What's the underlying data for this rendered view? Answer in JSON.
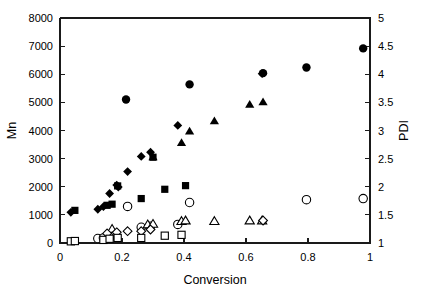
{
  "chart_data": {
    "type": "scatter",
    "title": "",
    "xlabel": "Conversion",
    "ylabel": "Mn",
    "y2label": "PDI",
    "xlim": [
      0,
      1
    ],
    "ylim": [
      0,
      8000
    ],
    "y2lim": [
      1,
      5
    ],
    "xticks": [
      0,
      0.2,
      0.4,
      0.6,
      0.8,
      1
    ],
    "xticklabels": [
      "0",
      "0.2",
      "0.4",
      "0.6",
      "0.8",
      "1"
    ],
    "yticks": [
      0,
      1000,
      2000,
      3000,
      4000,
      5000,
      6000,
      7000,
      8000
    ],
    "yticklabels": [
      "0",
      "1000",
      "2000",
      "3000",
      "4000",
      "5000",
      "6000",
      "7000",
      "8000"
    ],
    "y2ticks": [
      1,
      1.5,
      2,
      2.5,
      3,
      3.5,
      4,
      4.5,
      5
    ],
    "y2ticklabels": [
      "1",
      "1.5",
      "2",
      "2.5",
      "3",
      "3.5",
      "4",
      "4.5",
      "5"
    ],
    "grid": false,
    "legend": "none",
    "marker_colors": {
      "filled": "#000000",
      "open_fill": "#ffffff",
      "open_stroke": "#000000"
    },
    "series": [
      {
        "name": "Mn filled diamond",
        "marker": "diamond",
        "filled": true,
        "axis": "left",
        "points": [
          [
            0.035,
            1090
          ],
          [
            0.122,
            1200
          ],
          [
            0.14,
            1290
          ],
          [
            0.16,
            1760
          ],
          [
            0.183,
            2060
          ],
          [
            0.188,
            1990
          ],
          [
            0.218,
            2540
          ],
          [
            0.262,
            3080
          ],
          [
            0.292,
            3230
          ],
          [
            0.38,
            4180
          ],
          [
            0.652,
            6020
          ]
        ]
      },
      {
        "name": "Mn filled square",
        "marker": "square",
        "filled": true,
        "axis": "left",
        "points": [
          [
            0.048,
            1160
          ],
          [
            0.152,
            1340
          ],
          [
            0.168,
            1380
          ],
          [
            0.186,
            2030
          ],
          [
            0.262,
            1580
          ],
          [
            0.3,
            3050
          ],
          [
            0.338,
            1910
          ],
          [
            0.405,
            2040
          ]
        ]
      },
      {
        "name": "Mn filled triangle",
        "marker": "triangle",
        "filled": true,
        "axis": "left",
        "points": [
          [
            0.3,
            3060
          ],
          [
            0.392,
            3570
          ],
          [
            0.418,
            3980
          ],
          [
            0.498,
            4340
          ],
          [
            0.612,
            4930
          ],
          [
            0.655,
            5020
          ]
        ]
      },
      {
        "name": "PDI filled circle",
        "marker": "circle",
        "filled": true,
        "axis": "right",
        "points": [
          [
            0.213,
            3.55
          ],
          [
            0.418,
            3.82
          ],
          [
            0.655,
            4.02
          ],
          [
            0.795,
            4.12
          ],
          [
            0.978,
            4.46
          ]
        ]
      },
      {
        "name": "PDI open circle",
        "marker": "circle",
        "filled": false,
        "axis": "right",
        "points": [
          [
            0.122,
            1.08
          ],
          [
            0.14,
            1.09
          ],
          [
            0.16,
            1.1
          ],
          [
            0.218,
            1.65
          ],
          [
            0.262,
            1.28
          ],
          [
            0.292,
            1.3
          ],
          [
            0.38,
            1.33
          ],
          [
            0.418,
            1.72
          ],
          [
            0.795,
            1.77
          ],
          [
            0.978,
            1.79
          ]
        ]
      },
      {
        "name": "PDI open triangle",
        "marker": "triangle",
        "filled": false,
        "axis": "right",
        "points": [
          [
            0.168,
            1.25
          ],
          [
            0.283,
            1.33
          ],
          [
            0.3,
            1.34
          ],
          [
            0.392,
            1.39
          ],
          [
            0.405,
            1.4
          ],
          [
            0.498,
            1.39
          ],
          [
            0.612,
            1.4
          ],
          [
            0.652,
            1.4
          ]
        ]
      },
      {
        "name": "PDI open diamond",
        "marker": "diamond",
        "filled": false,
        "axis": "right",
        "points": [
          [
            0.152,
            1.17
          ],
          [
            0.183,
            1.19
          ],
          [
            0.218,
            1.21
          ],
          [
            0.262,
            1.21
          ],
          [
            0.292,
            1.24
          ],
          [
            0.655,
            1.4
          ]
        ]
      },
      {
        "name": "Mn open square",
        "marker": "square",
        "filled": false,
        "axis": "left",
        "points": [
          [
            0.035,
            60
          ],
          [
            0.048,
            70
          ],
          [
            0.14,
            110
          ],
          [
            0.16,
            150
          ],
          [
            0.186,
            180
          ],
          [
            0.262,
            180
          ],
          [
            0.338,
            260
          ],
          [
            0.392,
            290
          ]
        ]
      }
    ]
  }
}
